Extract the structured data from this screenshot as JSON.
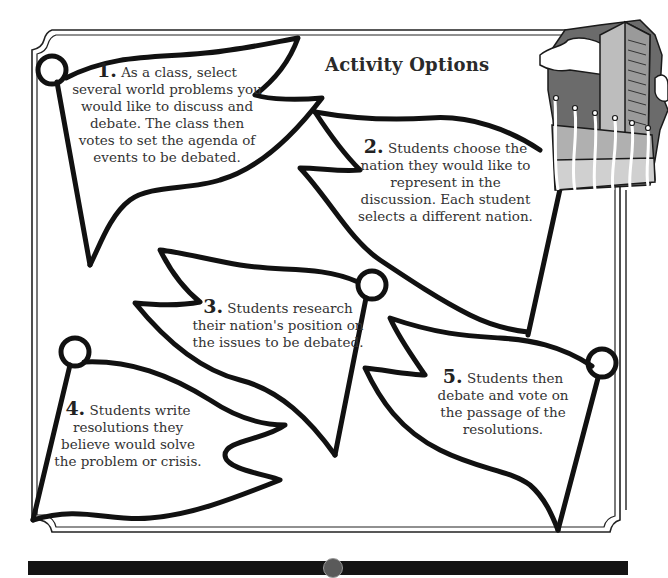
{
  "page": {
    "title": "Activity Options"
  },
  "flags": [
    {
      "number": "1.",
      "text": "As a class, select several world problems you would like to discuss and debate. The class then votes to set the agenda of events to be debated."
    },
    {
      "number": "2.",
      "text": "Students choose the nation they would like to represent in the discussion. Each student selects a different nation."
    },
    {
      "number": "3.",
      "text": "Students research their nation's position on the issues to be debated."
    },
    {
      "number": "4.",
      "text": "Students write resolutions they believe would solve the problem or crisis."
    },
    {
      "number": "5.",
      "text": "Students then debate and vote on the passage of the resolutions."
    }
  ],
  "illustration": {
    "icon": "united-nations-building-with-flags-icon"
  },
  "footer": {
    "icon": "globe-icon",
    "bar_color": "#141414"
  },
  "colors": {
    "ink": "#1a1a1a",
    "paper": "#ffffff",
    "gray_sky": "#6b6b6b",
    "gray_building": "#b5b5b5"
  }
}
